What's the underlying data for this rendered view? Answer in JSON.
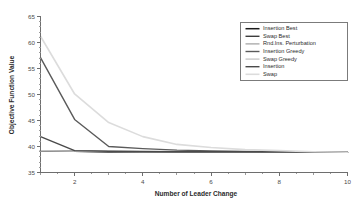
{
  "chart_data": {
    "type": "line",
    "title": "",
    "xlabel": "Number of Leader Change",
    "ylabel": "Objective Function Value",
    "xlim": [
      1,
      10
    ],
    "ylim": [
      35,
      65
    ],
    "x_ticks_major": [
      2,
      4,
      6,
      8,
      10
    ],
    "x_ticks_minor": [
      1,
      3,
      5,
      7,
      9
    ],
    "y_ticks_major": [
      35,
      40,
      45,
      50,
      55,
      60,
      65
    ],
    "grid": false,
    "legend_position": "top-right",
    "x": [
      1,
      2,
      3,
      4,
      5,
      6,
      7,
      8,
      9,
      10
    ],
    "series": [
      {
        "name": "Insertion Best",
        "color": "#1a1a1a",
        "width": 1.5,
        "values": [
          39.2,
          39.1,
          39.0,
          39.0,
          39.0,
          39.0,
          39.0,
          39.0,
          38.95,
          38.9
        ]
      },
      {
        "name": "Swap Best",
        "color": "#3d3d3d",
        "width": 1.4,
        "values": [
          39.2,
          39.1,
          39.0,
          39.0,
          39.0,
          39.0,
          39.0,
          39.0,
          38.95,
          38.9
        ]
      },
      {
        "name": "Rnd.Ins. Perturbation",
        "color": "#9e9e9e",
        "width": 1.2,
        "values": [
          39.2,
          39.1,
          39.05,
          39.0,
          39.0,
          39.0,
          39.0,
          39.0,
          38.95,
          38.9
        ]
      },
      {
        "name": "Insertion Greedy",
        "color": "#5a5a5a",
        "width": 1.4,
        "values": [
          57.1,
          45.2,
          40.0,
          39.6,
          39.3,
          39.15,
          39.05,
          39.0,
          38.95,
          38.9
        ]
      },
      {
        "name": "Swap Greedy",
        "color": "#c4c4c4",
        "width": 1.3,
        "values": [
          39.2,
          39.1,
          39.05,
          39.0,
          39.0,
          39.0,
          39.0,
          39.0,
          38.95,
          38.9
        ]
      },
      {
        "name": "Insertion",
        "color": "#4a4a4a",
        "width": 1.4,
        "values": [
          41.9,
          39.2,
          39.1,
          39.05,
          39.0,
          39.0,
          39.0,
          39.0,
          38.95,
          38.9
        ]
      },
      {
        "name": "Swap",
        "color": "#dcdcdc",
        "width": 1.6,
        "values": [
          61.2,
          50.1,
          44.6,
          41.9,
          40.4,
          39.8,
          39.4,
          39.2,
          39.0,
          38.9
        ]
      }
    ]
  },
  "legend": {
    "entries": [
      {
        "label": "Insertion Best"
      },
      {
        "label": "Swap Best"
      },
      {
        "label": "Rnd.Ins. Perturbation"
      },
      {
        "label": "Insertion Greedy"
      },
      {
        "label": "Swap Greedy"
      },
      {
        "label": "Insertion"
      },
      {
        "label": "Swap"
      }
    ]
  },
  "colors": {
    "background": "#ffffff",
    "axis": "#6e6e6e",
    "text": "#2b2b2b"
  }
}
